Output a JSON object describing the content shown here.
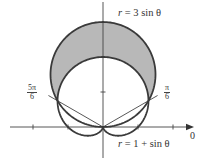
{
  "figure": {
    "labels": {
      "outer_curve": {
        "lhs": "r",
        "rhs": "3 sin θ"
      },
      "inner_curve": {
        "lhs": "r",
        "rhs": "1 + sin θ"
      },
      "angle_right": {
        "num": "π",
        "den": "6"
      },
      "angle_left": {
        "num": "5π",
        "den": "6"
      },
      "polar_axis": "0"
    },
    "colors": {
      "curve": "#3a3a3a",
      "shade": "#b8b8b8",
      "axis": "#444444"
    }
  },
  "chart_data": {
    "type": "polar",
    "title": "",
    "curves": [
      {
        "name": "r = 3 sin θ",
        "equation": "r = 3*sin(theta)",
        "shape": "circle",
        "center": [
          0,
          1.5
        ],
        "radius": 1.5
      },
      {
        "name": "r = 1 + sin θ",
        "equation": "r = 1 + sin(theta)",
        "shape": "cardioid"
      }
    ],
    "intersections": [
      {
        "theta": "π/6",
        "r": 1.5
      },
      {
        "theta": "5π/6",
        "r": 1.5
      },
      {
        "theta": "0 (pole)",
        "r": 0
      }
    ],
    "shaded_region": "inside r = 3 sin θ and outside r = 1 + sin θ, for π/6 ≤ θ ≤ 5π/6",
    "rays": [
      "θ = π/6",
      "θ = 5π/6"
    ],
    "axis_ticks_x": [
      -2,
      -1,
      1,
      2
    ],
    "axis_ticks_y": [
      1
    ],
    "scale_px_per_unit": 35,
    "origin_px": [
      103,
      127
    ]
  }
}
